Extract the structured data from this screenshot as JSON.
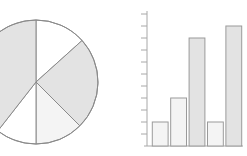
{
  "figure": {
    "background_color": "#ffffff",
    "width": 247,
    "height": 156,
    "panels": [
      {
        "id": "pie",
        "label": "Pie chart"
      },
      {
        "id": "bar",
        "label": "Bar chart"
      }
    ]
  },
  "style": {
    "slice_fill": "#e3e3e3",
    "slice_fill_empty": "#ffffff",
    "slice_stroke": "#8a8a8a",
    "bar_fill": "#e3e3e3",
    "bar_fill_light": "#f2f2f2",
    "bar_stroke": "#9a9a9a",
    "axis_color": "#a8a8a8",
    "stroke_width": 1
  },
  "chart_data": [
    {
      "type": "pie",
      "title": "",
      "center_x": 36,
      "center_y": 82,
      "radius": 62,
      "start_angle_deg": 0,
      "direction": "clockwise",
      "labels": [
        "Slice 1",
        "Slice 2",
        "Slice 3",
        "Slice 4",
        "Slice 5"
      ],
      "values": [
        13,
        24,
        13,
        11,
        39
      ],
      "percentages": [
        13,
        24,
        13,
        11,
        39
      ],
      "boundary_angles_deg": [
        0,
        48,
        135,
        180,
        218,
        360
      ],
      "slice_fills": [
        "#ffffff",
        "#e3e3e3",
        "#f4f4f4",
        "#ffffff",
        "#e3e3e3"
      ],
      "legend": false,
      "grid": false
    },
    {
      "type": "bar",
      "title": "",
      "xlabel": "",
      "ylabel": "",
      "categories": [
        "1",
        "2",
        "3",
        "4",
        "5"
      ],
      "values": [
        2,
        4,
        9,
        2,
        10
      ],
      "ylim": [
        0,
        11
      ],
      "y_tick_values": [
        0,
        1,
        2,
        3,
        4,
        5,
        6,
        7,
        8,
        9,
        10,
        11
      ],
      "y_tick_labels": [
        "",
        "",
        "",
        "",
        "",
        "",
        "",
        "",
        "",
        "",
        "",
        ""
      ],
      "x_tick_labels": [
        "",
        "",
        "",
        "",
        ""
      ],
      "bar_fills": [
        "#f4f4f4",
        "#f4f4f4",
        "#e3e3e3",
        "#f4f4f4",
        "#e3e3e3"
      ],
      "grid": false,
      "legend": false,
      "axis_left": true,
      "axis_bottom": true
    }
  ]
}
